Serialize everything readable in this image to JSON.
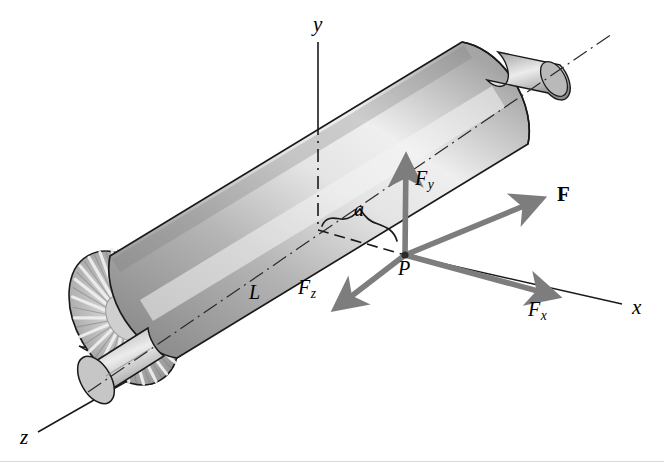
{
  "figure": {
    "background_color": "#ffffff",
    "body": {
      "name": "motor-cylinder",
      "description": "Cylindrical motor housing with finned end cap and two protruding shafts, drawn in oblique projection",
      "surface_light_color": "#e8e8e8",
      "surface_mid_color": "#b4b4b4",
      "surface_dark_color": "#8e8e8e",
      "outline_color": "#1a1a1a",
      "fin_count": 22,
      "fin_highlight_color": "#f2f2f2"
    },
    "axes": [
      {
        "id": "y",
        "label": "y",
        "label_x": 313,
        "label_y": 18,
        "direction": "up",
        "line_style": "dash-dot",
        "color": "#1a1a1a"
      },
      {
        "id": "x",
        "label": "x",
        "label_x": 632,
        "label_y": 299,
        "direction": "down-right",
        "line_style": "solid",
        "color": "#1a1a1a"
      },
      {
        "id": "z",
        "label": "z",
        "label_x": 20,
        "label_y": 429,
        "direction": "down-left",
        "line_style": "solid",
        "color": "#1a1a1a"
      }
    ],
    "origin_point": {
      "label": "P",
      "label_x": 398,
      "label_y": 259,
      "marker_x": 405,
      "marker_y": 255,
      "marker_color": "#1a1a1a"
    },
    "dimensions": [
      {
        "id": "a",
        "label": "a",
        "label_x": 353,
        "label_y": 200,
        "description": "distance along the axis from the y-axis to point P",
        "brace_color": "#1a1a1a",
        "leader_style": "dashed"
      },
      {
        "id": "L",
        "label": "L",
        "label_x": 249,
        "label_y": 281,
        "description": "overall length along the motor centerline",
        "leader_style": "dash-dot"
      }
    ],
    "vectors": [
      {
        "id": "F",
        "label": "F",
        "bold": true,
        "label_x": 557,
        "label_y": 184,
        "from_x": 405,
        "from_y": 255,
        "to_x": 545,
        "to_y": 196,
        "color": "#7d7d7d",
        "description": "resultant applied force"
      },
      {
        "id": "Fy",
        "label": "F",
        "subscript": "y",
        "label_x": 417,
        "label_y": 170,
        "from_x": 405,
        "from_y": 255,
        "to_x": 406,
        "to_y": 152,
        "color": "#7d7d7d",
        "description": "y-component of F, vertical"
      },
      {
        "id": "Fx",
        "label": "F",
        "subscript": "x",
        "label_x": 529,
        "label_y": 300,
        "from_x": 405,
        "from_y": 255,
        "to_x": 560,
        "to_y": 297,
        "color": "#7d7d7d",
        "description": "x-component of F, down-right along x axis"
      },
      {
        "id": "Fz",
        "label": "F",
        "subscript": "z",
        "label_x": 299,
        "label_y": 278,
        "from_x": 405,
        "from_y": 255,
        "to_x": 331,
        "to_y": 312,
        "color": "#7d7d7d",
        "description": "z-component of F, down-left along z axis"
      }
    ]
  }
}
